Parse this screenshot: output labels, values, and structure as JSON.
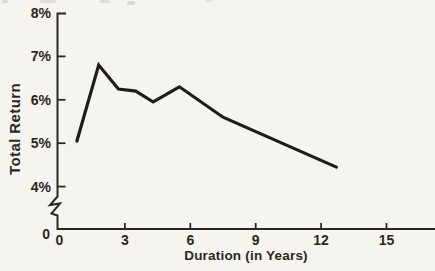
{
  "figure": {
    "background_color": "#f6f4ee",
    "ink_color": "#2b2823",
    "line_color": "#201d19"
  },
  "chart_data": {
    "type": "line",
    "title": "",
    "xlabel": "Duration (in Years)",
    "ylabel": "Total Return",
    "points": [
      [
        0.8,
        5.05
      ],
      [
        1.8,
        6.8
      ],
      [
        2.7,
        6.25
      ],
      [
        3.5,
        6.2
      ],
      [
        4.3,
        5.95
      ],
      [
        5.5,
        6.3
      ],
      [
        7.5,
        5.6
      ],
      [
        12.7,
        4.45
      ]
    ],
    "x_ticks": [
      {
        "value": 0,
        "label": "0"
      },
      {
        "value": 3,
        "label": "3"
      },
      {
        "value": 6,
        "label": "6"
      },
      {
        "value": 9,
        "label": "9"
      },
      {
        "value": 12,
        "label": "12"
      },
      {
        "value": 15,
        "label": "15"
      }
    ],
    "y_ticks": [
      {
        "value": 8,
        "label": "8%"
      },
      {
        "value": 7,
        "label": "7%"
      },
      {
        "value": 6,
        "label": "6%"
      },
      {
        "value": 5,
        "label": "5%"
      },
      {
        "value": 4,
        "label": "4%"
      }
    ],
    "y_axis_origin_label": "0",
    "y_axis_break": true,
    "xlim": [
      0,
      17.3
    ],
    "ylim": [
      4,
      8
    ],
    "grid": false,
    "legend": "none",
    "units": {
      "x": "years",
      "y": "percent"
    }
  }
}
